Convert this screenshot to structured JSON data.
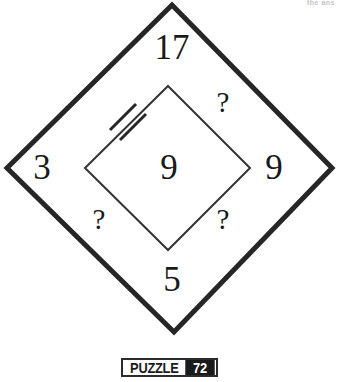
{
  "page": {
    "artifact_text": "the ans"
  },
  "figure": {
    "name": "nested-diamond-number-puzzle",
    "outer_diamond": {
      "label": "outer-diamond",
      "stroke_color": "#262626",
      "stroke_width": 5,
      "vertices": {
        "top": [
          172,
          5
        ],
        "right": [
          332,
          168
        ],
        "bottom": [
          174,
          332
        ],
        "left": [
          7,
          168
        ]
      }
    },
    "inner_diamond": {
      "label": "inner-diamond",
      "stroke_color": "#333333",
      "stroke_width": 2,
      "vertices": {
        "top": [
          168,
          86
        ],
        "right": [
          250,
          168
        ],
        "bottom": [
          168,
          250
        ],
        "left": [
          85,
          168
        ]
      }
    },
    "tick_marks": {
      "name": "double-tick-congruence-marks",
      "count": 2,
      "on_edge": "inner-diamond-upper-left",
      "stroke_color": "#262626",
      "stroke_width": 3
    },
    "labels": {
      "top": "17",
      "left": "3",
      "right": "9",
      "bottom": "5",
      "center": "9",
      "q_top_right": "?",
      "q_bottom_left": "?",
      "q_bottom_right": "?"
    }
  },
  "footer": {
    "badge_word": "PUZZLE",
    "badge_number": "72"
  },
  "colors": {
    "ink": "#1a1a1a",
    "line": "#262626",
    "paper": "#ffffff",
    "badge_fill": "#1a1a1a",
    "artifact": "#b9b9b9"
  }
}
